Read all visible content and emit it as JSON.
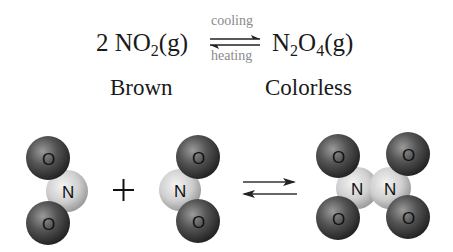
{
  "equation": {
    "reactant": {
      "coefficient": "2",
      "formula_main": "NO",
      "subscript": "2",
      "state": "(g)"
    },
    "product": {
      "formula_a": "N",
      "subscript_a": "2",
      "formula_b": "O",
      "subscript_b": "4",
      "state": "(g)"
    },
    "forward_condition": "cooling",
    "reverse_condition": "heating"
  },
  "labels": {
    "reactant_color": "Brown",
    "product_color": "Colorless"
  },
  "molecules": {
    "no2_left": {
      "atoms": [
        "O",
        "N",
        "O"
      ]
    },
    "plus_sign": "+",
    "no2_right": {
      "atoms": [
        "O",
        "N",
        "O"
      ]
    },
    "n2o4": {
      "atoms": [
        "O",
        "O",
        "N",
        "N",
        "O",
        "O"
      ]
    }
  },
  "colors": {
    "oxygen": "#4a4a4a",
    "nitrogen": "#d8d8d8",
    "text": "#1a1a1a",
    "condition_text": "#8a8a8a"
  }
}
